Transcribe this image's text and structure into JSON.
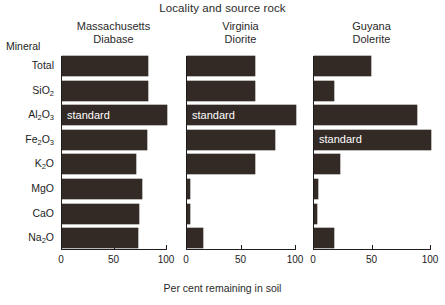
{
  "chart_data": {
    "type": "bar",
    "title": "Locality and source rock",
    "xlabel": "Per cent remaining in soil",
    "ylabel": "Mineral",
    "categories": [
      "Total",
      "SiO2",
      "Al2O3",
      "Fe2O3",
      "K2O",
      "MgO",
      "CaO",
      "Na2O"
    ],
    "category_labels_html": [
      "Total",
      "SiO<sub>2</sub>",
      "Al<sub>2</sub>O<sub>3</sub>",
      "Fe<sub>2</sub>O<sub>3</sub>",
      "K<sub>2</sub>O",
      "MgO",
      "CaO",
      "Na<sub>2</sub>O"
    ],
    "xlim": [
      0,
      100
    ],
    "xticks": [
      0,
      50,
      100
    ],
    "xtick_labels": [
      "0",
      "50",
      "100"
    ],
    "grid": false,
    "legend": "none",
    "orientation": "horizontal",
    "bar_color": "#332a26",
    "standard_label": "standard",
    "series": [
      {
        "name": "Massachusetts Diabase",
        "locality": "Massachusetts",
        "rock": "Diabase",
        "values": [
          82,
          82,
          100,
          81,
          70,
          76,
          73,
          72
        ],
        "standard_category": "Al2O3"
      },
      {
        "name": "Virginia Diorite",
        "locality": "Virginia",
        "rock": "Diorite",
        "values": [
          62,
          62,
          100,
          80,
          62,
          2,
          2,
          14
        ],
        "standard_category": "Al2O3"
      },
      {
        "name": "Guyana Dolerite",
        "locality": "Guyana",
        "rock": "Dolerite",
        "values": [
          48,
          17,
          88,
          100,
          22,
          3,
          2,
          17
        ],
        "standard_category": "Fe2O3"
      }
    ]
  },
  "labels": {
    "mineral_caption": "Mineral"
  }
}
